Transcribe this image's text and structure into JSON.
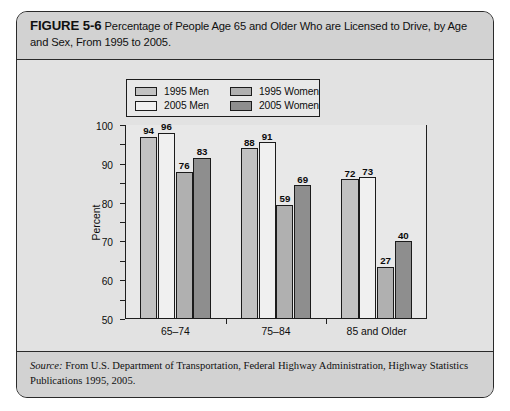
{
  "figure": {
    "label": "FIGURE 5-6",
    "caption": "Percentage of People Age 65 and Older Who are Licensed to Drive, by Age and Sex, From 1995 to 2005.",
    "source_word": "Source:",
    "source_text": " From U.S. Department of Transportation, Federal Highway Administration, Highway Statistics Publications 1995, 2005."
  },
  "legend": {
    "entries": [
      {
        "label": "1995 Men",
        "color": "#c2c2c2"
      },
      {
        "label": "1995 Women",
        "color": "#b0b0b0"
      },
      {
        "label": "2005 Men",
        "color": "#f0f0f0"
      },
      {
        "label": "2005 Women",
        "color": "#8e8e8e"
      }
    ]
  },
  "chart_data": {
    "type": "bar",
    "title": "Percentage of People Age 65 and Older Who are Licensed to Drive, by Age and Sex, From 1995 to 2005.",
    "xlabel": "",
    "ylabel": "Percent",
    "ylim": [
      0,
      100
    ],
    "yticks": [
      0,
      10,
      20,
      30,
      40,
      50,
      60,
      70,
      80,
      90,
      100
    ],
    "ytick_labels": [
      "0",
      "10",
      "20",
      "30",
      "40",
      "50",
      "60",
      "70",
      "80",
      "90",
      "100"
    ],
    "grid": false,
    "legend_position": "top-left",
    "categories": [
      "65–74",
      "75–84",
      "85 and Older"
    ],
    "series": [
      {
        "name": "1995 Men",
        "color": "#c2c2c2",
        "values": [
          94,
          88,
          72
        ]
      },
      {
        "name": "2005 Men",
        "color": "#f0f0f0",
        "values": [
          96,
          91,
          73
        ]
      },
      {
        "name": "1995 Women",
        "color": "#b0b0b0",
        "values": [
          76,
          59,
          27
        ]
      },
      {
        "name": "2005 Women",
        "color": "#8e8e8e",
        "values": [
          83,
          69,
          40
        ]
      }
    ]
  }
}
